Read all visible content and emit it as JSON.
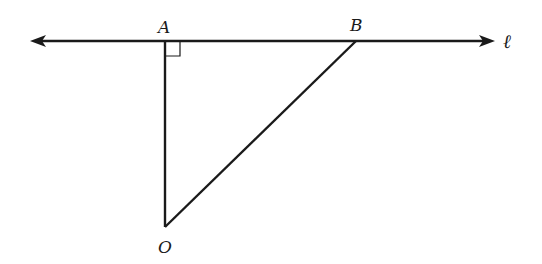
{
  "diagram": {
    "type": "geometry",
    "colors": {
      "stroke": "#1a1a1a",
      "background": "#ffffff"
    },
    "line": {
      "label": "ℓ",
      "x1": 30,
      "y1": 41,
      "x2": 494,
      "y2": 41,
      "arrows": "both"
    },
    "points": {
      "A": {
        "label": "A",
        "x": 165,
        "y": 41
      },
      "B": {
        "label": "B",
        "x": 356,
        "y": 41
      },
      "O": {
        "label": "O",
        "x": 165,
        "y": 227
      }
    },
    "segments": [
      {
        "from": "O",
        "to": "A"
      },
      {
        "from": "O",
        "to": "B"
      }
    ],
    "right_angle_marker": {
      "at": "A",
      "size": 13
    }
  }
}
